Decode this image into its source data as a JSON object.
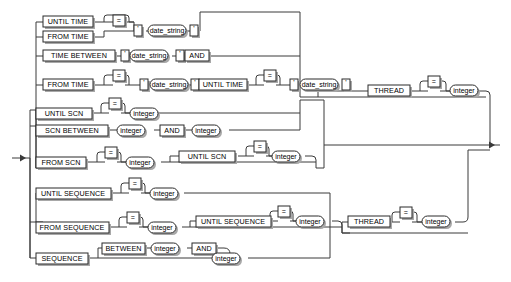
{
  "diagram": {
    "kind": "railroad-syntax-diagram",
    "title": "",
    "colors": {
      "background": "#ffffff",
      "line": "#3a3a3a",
      "box_border": "#2b2b2b",
      "box_fill": "#ffffff",
      "shadow": "#a8a8a8",
      "text": "#000000"
    },
    "entry_marker": "→",
    "exit_marker": "→",
    "alternatives": [
      {
        "id": "until-time",
        "row": 1,
        "tokens": [
          {
            "type": "terminal",
            "text": "UNTIL TIME"
          },
          {
            "type": "terminal",
            "text": "="
          },
          {
            "type": "terminal",
            "text": "'"
          },
          {
            "type": "nonterminal",
            "text": "date_string"
          },
          {
            "type": "terminal",
            "text": "'"
          }
        ]
      },
      {
        "id": "from-time",
        "row": 2,
        "tokens": [
          {
            "type": "terminal",
            "text": "FROM TIME"
          },
          {
            "type": "terminal",
            "text": "="
          },
          {
            "type": "terminal",
            "text": "'"
          },
          {
            "type": "nonterminal",
            "text": "date_string"
          },
          {
            "type": "terminal",
            "text": "'"
          }
        ]
      },
      {
        "id": "time-between",
        "row": 3,
        "tokens": [
          {
            "type": "terminal",
            "text": "TIME BETWEEN"
          },
          {
            "type": "terminal",
            "text": "'"
          },
          {
            "type": "nonterminal",
            "text": "date_string"
          },
          {
            "type": "terminal",
            "text": "'"
          },
          {
            "type": "terminal",
            "text": "AND"
          }
        ]
      },
      {
        "id": "from-time-until-time",
        "row": 4,
        "tokens": [
          {
            "type": "terminal",
            "text": "FROM TIME"
          },
          {
            "type": "terminal",
            "text": "="
          },
          {
            "type": "terminal",
            "text": "'"
          },
          {
            "type": "nonterminal",
            "text": "date_string"
          },
          {
            "type": "terminal",
            "text": "'"
          },
          {
            "type": "terminal",
            "text": "UNTIL TIME"
          },
          {
            "type": "terminal",
            "text": "="
          },
          {
            "type": "terminal",
            "text": "'"
          },
          {
            "type": "nonterminal",
            "text": "date_string"
          },
          {
            "type": "terminal",
            "text": "'"
          }
        ]
      },
      {
        "id": "until-scn",
        "row": 5,
        "tokens": [
          {
            "type": "terminal",
            "text": "UNTIL SCN"
          },
          {
            "type": "terminal",
            "text": "="
          },
          {
            "type": "nonterminal",
            "text": "integer"
          }
        ]
      },
      {
        "id": "scn-between",
        "row": 6,
        "tokens": [
          {
            "type": "terminal",
            "text": "SCN BETWEEN"
          },
          {
            "type": "nonterminal",
            "text": "integer"
          },
          {
            "type": "terminal",
            "text": "AND"
          },
          {
            "type": "nonterminal",
            "text": "integer"
          }
        ]
      },
      {
        "id": "from-scn-until-scn",
        "row": 7,
        "tokens": [
          {
            "type": "terminal",
            "text": "FROM SCN"
          },
          {
            "type": "terminal",
            "text": "="
          },
          {
            "type": "nonterminal",
            "text": "integer"
          },
          {
            "type": "terminal",
            "text": "UNTIL SCN"
          },
          {
            "type": "terminal",
            "text": "="
          },
          {
            "type": "nonterminal",
            "text": "integer"
          }
        ]
      },
      {
        "id": "until-sequence",
        "row": 8,
        "tokens": [
          {
            "type": "terminal",
            "text": "UNTIL SEQUENCE"
          },
          {
            "type": "terminal",
            "text": "="
          },
          {
            "type": "nonterminal",
            "text": "integer"
          }
        ]
      },
      {
        "id": "from-sequence-until-sequence",
        "row": 9,
        "tokens": [
          {
            "type": "terminal",
            "text": "FROM SEQUENCE"
          },
          {
            "type": "terminal",
            "text": "="
          },
          {
            "type": "nonterminal",
            "text": "integer"
          },
          {
            "type": "terminal",
            "text": "UNTIL SEQUENCE"
          },
          {
            "type": "terminal",
            "text": "="
          },
          {
            "type": "nonterminal",
            "text": "integer"
          }
        ]
      },
      {
        "id": "sequence-between",
        "row": 10,
        "tokens": [
          {
            "type": "terminal",
            "text": "SEQUENCE"
          },
          {
            "type": "terminal",
            "text": "BETWEEN"
          },
          {
            "type": "nonterminal",
            "text": "integer"
          },
          {
            "type": "terminal",
            "text": "AND"
          },
          {
            "type": "nonterminal",
            "text": "integer"
          }
        ]
      }
    ],
    "thread_clauses": [
      {
        "id": "thread-upper",
        "tokens": [
          {
            "type": "terminal",
            "text": "THREAD"
          },
          {
            "type": "terminal",
            "text": "="
          },
          {
            "type": "nonterminal",
            "text": "integer"
          }
        ]
      },
      {
        "id": "thread-lower",
        "tokens": [
          {
            "type": "terminal",
            "text": "THREAD"
          },
          {
            "type": "terminal",
            "text": "="
          },
          {
            "type": "nonterminal",
            "text": "integer"
          }
        ]
      }
    ],
    "labels": {
      "until_time": "UNTIL TIME",
      "from_time": "FROM TIME",
      "time_between": "TIME BETWEEN",
      "until_scn": "UNTIL SCN",
      "scn_between": "SCN BETWEEN",
      "from_scn": "FROM SCN",
      "until_sequence": "UNTIL SEQUENCE",
      "from_sequence": "FROM SEQUENCE",
      "sequence": "SEQUENCE",
      "between": "BETWEEN",
      "and": "AND",
      "thread": "THREAD",
      "eq": "=",
      "quote": "'",
      "date_string": "date_string",
      "integer": "integer"
    }
  }
}
